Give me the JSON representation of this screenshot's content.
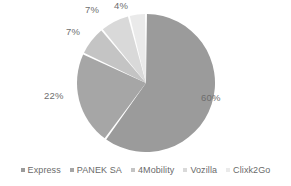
{
  "chart_data": {
    "type": "pie",
    "title": "",
    "subtitle": "",
    "xlabel": "",
    "ylabel": "",
    "grid": false,
    "legend_position": "bottom",
    "categories": [
      "Express",
      "PANEK SA",
      "4Mobility",
      "Vozilla",
      "Clixk2Go"
    ],
    "values": [
      60,
      22,
      7,
      7,
      4
    ],
    "value_labels": [
      "60%",
      "22%",
      "7%",
      "7%",
      "4%"
    ],
    "unit": "%",
    "colors": [
      "#9b9b9b",
      "#a6a6a6",
      "#c4c4c4",
      "#d9d9d9",
      "#eaeaea"
    ],
    "slices": [
      {
        "label": "Express",
        "value": 60,
        "display": "60%",
        "color": "#9b9b9b"
      },
      {
        "label": "PANEK SA",
        "value": 22,
        "display": "22%",
        "color": "#a6a6a6"
      },
      {
        "label": "4Mobility",
        "value": 7,
        "display": "7%",
        "color": "#c4c4c4"
      },
      {
        "label": "Vozilla",
        "value": 7,
        "display": "7%",
        "color": "#d9d9d9"
      },
      {
        "label": "Clixk2Go",
        "value": 4,
        "display": "4%",
        "color": "#eaeaea"
      }
    ]
  },
  "legend": {
    "items": [
      {
        "label": "Express",
        "color": "#9b9b9b"
      },
      {
        "label": "PANEK SA",
        "color": "#a6a6a6"
      },
      {
        "label": "4Mobility",
        "color": "#c4c4c4"
      },
      {
        "label": "Vozilla",
        "color": "#d9d9d9"
      },
      {
        "label": "Clixk2Go",
        "color": "#eaeaea"
      }
    ]
  }
}
